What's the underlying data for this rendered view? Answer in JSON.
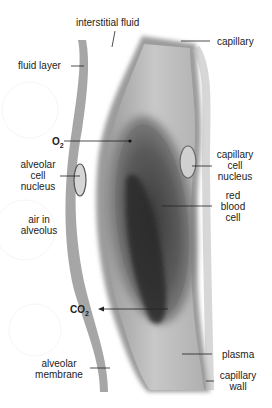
{
  "diagram": {
    "labels": {
      "interstitial_fluid": "interstitial fluid",
      "capillary": "capillary",
      "fluid_layer": "fluid layer",
      "o2": "O",
      "o2_sub": "2",
      "alveolar_cell_nucleus": [
        "alveolar",
        "cell",
        "nucleus"
      ],
      "capillary_cell_nucleus": [
        "capillary",
        "cell",
        "nucleus"
      ],
      "red_blood_cell": [
        "red",
        "blood",
        "cell"
      ],
      "air_in_alveolus": [
        "air in",
        "alveolus"
      ],
      "co2": "CO",
      "co2_sub": "2",
      "alveolar_membrane": [
        "alveolar",
        "membrane"
      ],
      "plasma": "plasma",
      "capillary_wall": [
        "capillary",
        "wall"
      ]
    },
    "colors": {
      "membrane": "#a8a8a8",
      "plasma": "#c4c4c4",
      "rbc_outer": "#7a7a7a",
      "rbc_core": "#2e2e2e",
      "leader": "#222222"
    }
  }
}
